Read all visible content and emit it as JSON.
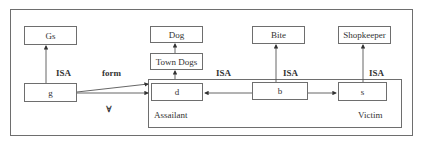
{
  "diagram": {
    "nodes": {
      "gs": "Gs",
      "g": "g",
      "dog": "Dog",
      "town_dogs": "Town Dogs",
      "d": "d",
      "bite": "Bite",
      "b": "b",
      "shopkeeper": "Shopkeeper",
      "s": "s"
    },
    "labels": {
      "isa_g": "ISA",
      "form": "form",
      "forall": "∀",
      "isa_d": "ISA",
      "isa_b": "ISA",
      "isa_s": "ISA",
      "assailant": "Assailant",
      "victim": "Victim"
    },
    "edges": [
      {
        "from": "g",
        "to": "gs",
        "label": "ISA"
      },
      {
        "from": "g",
        "to": "d",
        "label": "form"
      },
      {
        "from": "g",
        "to": "container",
        "label": "∀"
      },
      {
        "from": "town_dogs",
        "to": "dog"
      },
      {
        "from": "d",
        "to": "town_dogs",
        "label": "ISA"
      },
      {
        "from": "b",
        "to": "bite",
        "label": "ISA"
      },
      {
        "from": "b",
        "to": "d",
        "label": "Assailant"
      },
      {
        "from": "b",
        "to": "s",
        "label": "Victim"
      },
      {
        "from": "s",
        "to": "shopkeeper",
        "label": "ISA"
      }
    ]
  }
}
